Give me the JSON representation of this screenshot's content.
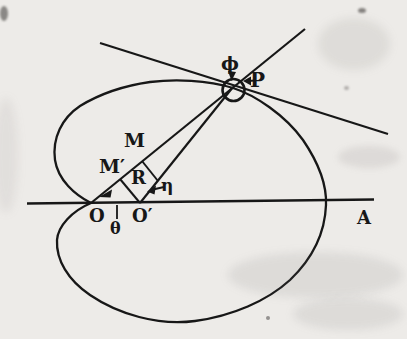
{
  "figure": {
    "paper_color": "#edebe8",
    "ink_color": "#171717",
    "labels": {
      "phi": "ϕ",
      "P": "P",
      "M": "M",
      "M_prime": "M′",
      "R": "R",
      "eta": "η",
      "O": "O",
      "theta": "θ",
      "O_prime": "O′",
      "A": "A"
    },
    "icons": {
      "phi_arrow": "down-arrowhead",
      "p_arrow": "left-arrowhead",
      "eta_arrow": "left-arrowhead",
      "theta_arrow": "left-arrowhead"
    }
  }
}
